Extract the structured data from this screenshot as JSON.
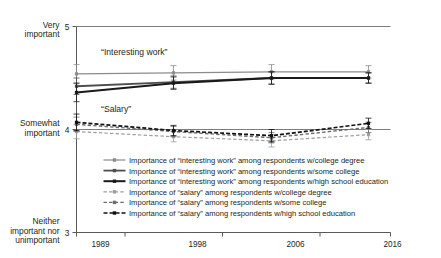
{
  "chart_data": {
    "type": "line",
    "title": "",
    "xlabel": "",
    "ylabel": "",
    "x": [
      1989,
      1998,
      2006,
      2016
    ],
    "categories": [
      "1989",
      "1998",
      "2006",
      "2016"
    ],
    "ylim": [
      3,
      5
    ],
    "xlim": [
      1985,
      2020
    ],
    "grid": false,
    "legend_position": "bottom",
    "y_tick_values": [
      5,
      4,
      3
    ],
    "y_tick_numbers": [
      "5",
      "4",
      "3"
    ],
    "y_tick_labels": [
      "Very\nimportant",
      "Somewhat\nimportant",
      "Neither\nimportant nor\nunimportant"
    ],
    "y_axis_labels": {
      "top_line1": "Very",
      "top_line2": "important",
      "mid_line1": "Somewhat",
      "mid_line2": "important",
      "bottom_line1": "Neither",
      "bottom_line2": "important nor",
      "bottom_line3": "unimportant",
      "top_number": "5",
      "mid_number": "4",
      "bottom_number": "3"
    },
    "annotations": [
      {
        "text": "“Interesting work”",
        "x": 1986.4,
        "y": 4.72
      },
      {
        "text": "“Salary”",
        "x": 1986.4,
        "y": 4.17
      }
    ],
    "series": [
      {
        "name": "Importance of “interesting work” among respondents w/college degree",
        "short_name": "interesting-work-college-degree",
        "values": [
          4.54,
          4.55,
          4.56,
          4.56
        ],
        "errors": [
          0.09,
          0.07,
          0.07,
          0.06
        ],
        "color": "#8c8c8c",
        "style": "solid",
        "width": 1.2,
        "marker": "square"
      },
      {
        "name": "Importance of “interesting work” among respondents w/some college",
        "short_name": "interesting-work-some-college",
        "values": [
          4.42,
          4.46,
          4.5,
          4.5
        ],
        "errors": [
          0.08,
          0.06,
          0.06,
          0.05
        ],
        "color": "#4d4d4d",
        "style": "solid",
        "width": 1.8,
        "marker": "square"
      },
      {
        "name": "Importance of “interesting work” among respondents w/high school education",
        "short_name": "interesting-work-high-school",
        "values": [
          4.36,
          4.45,
          4.5,
          4.5
        ],
        "errors": [
          0.09,
          0.06,
          0.06,
          0.05
        ],
        "color": "#1a1a1a",
        "style": "solid",
        "width": 2.0,
        "marker": "square"
      },
      {
        "name": "Importance of “salary” among respondents w/college degree",
        "short_name": "salary-college-degree",
        "values": [
          3.98,
          3.93,
          3.89,
          3.95
        ],
        "errors": [
          0.07,
          0.05,
          0.06,
          0.05
        ],
        "color": "#9e9e9e",
        "style": "dashed",
        "width": 1.2,
        "marker": "square"
      },
      {
        "name": "Importance of “salary” among respondents w/some college",
        "short_name": "salary-some-college",
        "values": [
          4.05,
          3.98,
          3.92,
          4.02
        ],
        "errors": [
          0.07,
          0.05,
          0.05,
          0.05
        ],
        "color": "#6b6b6b",
        "style": "dashed",
        "width": 1.4,
        "marker": "square"
      },
      {
        "name": "Importance of “salary” among respondents w/high school education",
        "short_name": "salary-high-school",
        "values": [
          4.07,
          3.99,
          3.94,
          4.06
        ],
        "errors": [
          0.08,
          0.05,
          0.06,
          0.05
        ],
        "color": "#111111",
        "style": "dashed",
        "width": 1.7,
        "marker": "square"
      }
    ]
  },
  "legend": {
    "items": [
      {
        "label": "Importance of “interesting work” among respondents w/college degree",
        "series_index": 0
      },
      {
        "label": "Importance of “interesting work” among respondents w/some college",
        "series_index": 1
      },
      {
        "label": "Importance of “interesting work” among respondents w/high school education",
        "series_index": 2
      },
      {
        "label": "Importance of “salary” among respondents w/college degree",
        "series_index": 3
      },
      {
        "label": "Importance of “salary” among respondents w/some college",
        "series_index": 4
      },
      {
        "label": "Importance of “salary” among respondents w/high school education",
        "series_index": 5
      }
    ]
  }
}
